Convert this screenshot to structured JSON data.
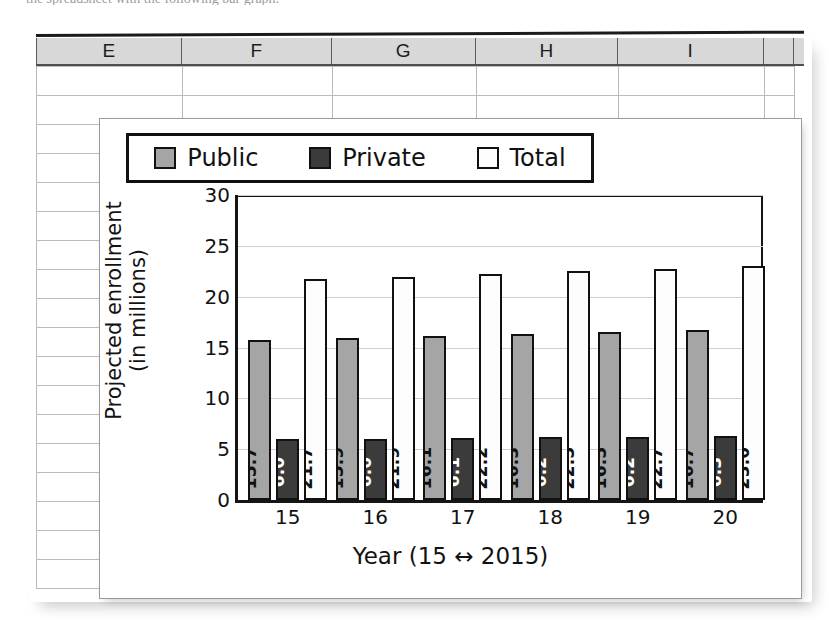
{
  "page": {
    "top_text_fragment": "the spreadsheet with the following bar graph:"
  },
  "spreadsheet": {
    "column_headers": [
      "E",
      "F",
      "G",
      "H",
      "I"
    ],
    "row_count": 19
  },
  "chart_data": {
    "type": "bar",
    "title": "College Enrollments",
    "xlabel": "Year (15 ↔ 2015)",
    "ylabel": "Projected enrollment",
    "ylabel_line2": "(in millions)",
    "categories": [
      "15",
      "16",
      "17",
      "18",
      "19",
      "20"
    ],
    "ylim": [
      0,
      30
    ],
    "yticks": [
      "0",
      "5",
      "10",
      "15",
      "20",
      "25",
      "30"
    ],
    "grid": true,
    "legend_position": "inside-top-left",
    "series": [
      {
        "name": "Public",
        "color": "#a5a5a5",
        "values": [
          15.7,
          15.9,
          16.1,
          16.3,
          16.5,
          16.7
        ],
        "labels": [
          "15.7",
          "15.9",
          "16.1",
          "16.3",
          "16.5",
          "16.7"
        ]
      },
      {
        "name": "Private",
        "color": "#3b3b3b",
        "values": [
          6.0,
          6.0,
          6.1,
          6.2,
          6.2,
          6.3
        ],
        "labels": [
          "6.0",
          "6.0",
          "6.1",
          "6.2",
          "6.2",
          "6.3"
        ]
      },
      {
        "name": "Total",
        "color": "#fdfdfd",
        "values": [
          21.7,
          21.9,
          22.2,
          22.5,
          22.7,
          23.0
        ],
        "labels": [
          "21.7",
          "21.9",
          "22.2",
          "22.5",
          "22.7",
          "23.0"
        ]
      }
    ]
  },
  "colors": {
    "public": "#a5a5a5",
    "private": "#3b3b3b",
    "total": "#fdfdfd",
    "outline": "#111111",
    "header_fill": "#d8d8d8",
    "gridline": "#cfcfcf"
  }
}
